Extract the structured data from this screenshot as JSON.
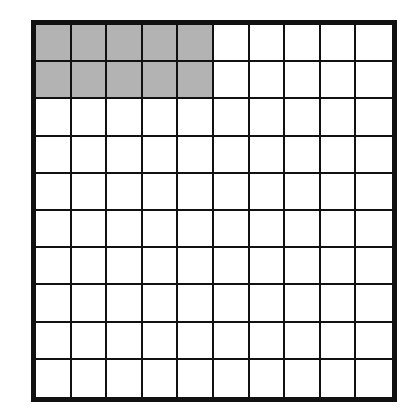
{
  "diagram": {
    "type": "hundred-grid",
    "rows": 10,
    "cols": 10,
    "shaded_rows": 2,
    "shaded_cols": 5,
    "shaded_count": 10,
    "total_cells": 100,
    "colors": {
      "shaded": "#b3b3b3",
      "unshaded": "#ffffff",
      "lines": "#111111"
    }
  }
}
